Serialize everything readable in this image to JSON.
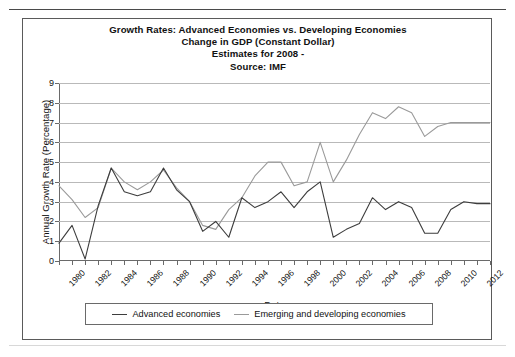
{
  "chart_box": {
    "title_lines": [
      "Growth Rates: Advanced Economies vs. Developing Economies",
      "Change in GDP (Constant Dollar)",
      "Estimates for 2008 -",
      "Source: IMF"
    ]
  },
  "colors": {
    "advanced_line": "#3d3d3d",
    "emerging_line": "#9a9a9a",
    "gridline": "#b9b9b9",
    "axis": "#6a6a6a",
    "frame": "#5a5a5a"
  },
  "chart_data": {
    "type": "line",
    "title": "Growth Rates: Advanced Economies vs. Developing Economies Change in GDP (Constant Dollar) Estimates for 2008 - Source: IMF",
    "xlabel": "Date",
    "ylabel": "Annual Growth Rate (Percentage)",
    "ylim": [
      0,
      9
    ],
    "yticks": [
      0,
      1,
      2,
      3,
      4,
      5,
      6,
      7,
      8,
      9
    ],
    "grid": true,
    "legend_position": "bottom",
    "x": [
      1980,
      1981,
      1982,
      1983,
      1984,
      1985,
      1986,
      1987,
      1988,
      1989,
      1990,
      1991,
      1992,
      1993,
      1994,
      1995,
      1996,
      1997,
      1998,
      1999,
      2000,
      2001,
      2002,
      2003,
      2004,
      2005,
      2006,
      2007,
      2008,
      2009,
      2010,
      2011,
      2012,
      2013
    ],
    "xtick_labels": [
      "1980",
      "1982",
      "1984",
      "1986",
      "1988",
      "1990",
      "1992",
      "1994",
      "1996",
      "1998",
      "2000",
      "2002",
      "2004",
      "2006",
      "2008",
      "2010",
      "2012"
    ],
    "series": [
      {
        "name": "Advanced economies",
        "color": "#3d3d3d",
        "values": [
          0.9,
          1.8,
          0.1,
          2.8,
          4.7,
          3.5,
          3.3,
          3.5,
          4.7,
          3.6,
          3.0,
          1.5,
          2.0,
          1.2,
          3.2,
          2.7,
          3.0,
          3.5,
          2.7,
          3.5,
          4.0,
          1.2,
          1.6,
          1.9,
          3.2,
          2.6,
          3.0,
          2.7,
          1.4,
          1.4,
          2.6,
          3.0,
          2.9,
          2.9
        ]
      },
      {
        "name": "Emerging and developing economies",
        "color": "#9a9a9a",
        "values": [
          3.8,
          3.1,
          2.2,
          2.7,
          4.7,
          4.0,
          3.6,
          4.0,
          4.6,
          3.7,
          3.0,
          1.8,
          1.6,
          2.6,
          3.2,
          4.3,
          5.0,
          5.0,
          3.8,
          4.0,
          6.0,
          4.0,
          5.1,
          6.4,
          7.5,
          7.2,
          7.8,
          7.5,
          6.3,
          6.8,
          7.0,
          7.0,
          7.0,
          7.0
        ]
      }
    ]
  },
  "legend": {
    "entries": [
      {
        "label": "Advanced economies"
      },
      {
        "label": "Emerging and developing economies"
      }
    ]
  }
}
